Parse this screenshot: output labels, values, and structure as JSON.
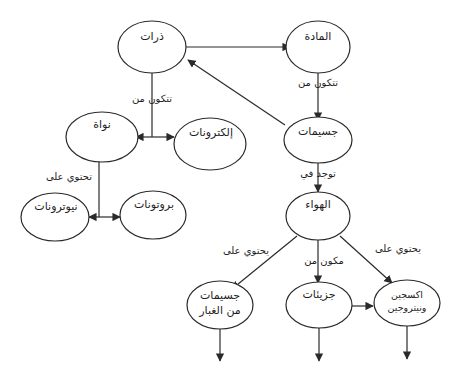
{
  "diagram": {
    "type": "concept-map",
    "nodes": {
      "atoms": "ذرات",
      "matter": "المادة",
      "particles": "جسيمات",
      "nucleus": "نواة",
      "electrons": "إلكترونات",
      "neutrons": "نيوترونات",
      "protons": "بروتونات",
      "air": "الهواء",
      "dust_particles": "جسيمات من الغبار",
      "molecules": "جزيئات",
      "oxygen_nitrogen": "اكسجين ونيتروجين"
    },
    "edge_labels": {
      "atoms_consist_of": "تتكون من",
      "matter_consists_of": "تتكون من",
      "nucleus_contains": "تحتوي على",
      "particles_found_in": "توجد في",
      "air_contains_dust": "يحتوي على",
      "air_made_of": "مكون من",
      "air_contains_gases": "يحتوي على"
    }
  }
}
